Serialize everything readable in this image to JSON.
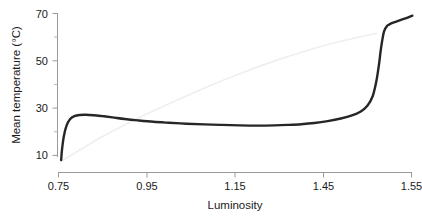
{
  "chart_data": {
    "type": "line",
    "title": "",
    "xlabel": "Luminosity",
    "ylabel": "Mean temperature (°C)",
    "xlim": [
      0.75,
      1.55
    ],
    "ylim": [
      4.5,
      72
    ],
    "grid": false,
    "legend": null,
    "x_ticks": [
      {
        "label": "0.75",
        "position": 0.75
      },
      {
        "label": "0.95",
        "position": 0.95
      },
      {
        "label": "1.15",
        "position": 1.15
      },
      {
        "label": "1.45",
        "position": 1.35
      },
      {
        "label": "1.55",
        "position": 1.55
      }
    ],
    "y_ticks_major": [
      {
        "label": "10",
        "value": 10
      },
      {
        "label": "30",
        "value": 30
      },
      {
        "label": "50",
        "value": 50
      },
      {
        "label": "70",
        "value": 70
      }
    ],
    "y_ticks_minor": [
      20,
      40,
      60
    ],
    "series": [
      {
        "name": "mean-temperature",
        "color": "#262626",
        "style": "solid-thick",
        "x": [
          0.756,
          0.758,
          0.762,
          0.768,
          0.776,
          0.786,
          0.798,
          0.812,
          0.83,
          0.85,
          0.872,
          0.9,
          0.93,
          0.965,
          1.0,
          1.04,
          1.08,
          1.12,
          1.16,
          1.2,
          1.24,
          1.27,
          1.3,
          1.33,
          1.36,
          1.39,
          1.415,
          1.435,
          1.45,
          1.462,
          1.47,
          1.476,
          1.48,
          1.484,
          1.488,
          1.494,
          1.5,
          1.51,
          1.525,
          1.54,
          1.552
        ],
        "y": [
          8.0,
          12.5,
          18.0,
          22.5,
          25.3,
          26.6,
          27.1,
          27.2,
          27.0,
          26.6,
          26.1,
          25.4,
          24.8,
          24.2,
          23.8,
          23.4,
          23.1,
          22.9,
          22.7,
          22.6,
          22.7,
          22.9,
          23.2,
          23.7,
          24.5,
          25.6,
          26.9,
          28.6,
          31.0,
          35.0,
          41.0,
          48.0,
          54.0,
          59.0,
          62.5,
          64.6,
          65.4,
          66.2,
          67.2,
          68.2,
          69.1
        ]
      },
      {
        "name": "reference-line",
        "color": "#efefef",
        "style": "solid-thin",
        "x": [
          0.757,
          0.85,
          0.95,
          1.05,
          1.15,
          1.25,
          1.35,
          1.43,
          1.47
        ],
        "y": [
          7.6,
          18.0,
          27.5,
          36.0,
          43.8,
          50.6,
          56.4,
          60.0,
          61.6
        ]
      }
    ]
  }
}
